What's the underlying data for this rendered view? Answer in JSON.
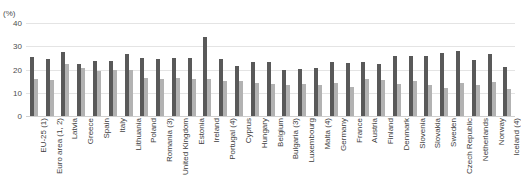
{
  "chart": {
    "title": "",
    "unit_label": "(%)"
  },
  "chart_data": {
    "type": "bar",
    "title": "",
    "xlabel": "",
    "ylabel": "(%)",
    "ylim": [
      0,
      40
    ],
    "yticks": [
      0,
      10,
      20,
      30,
      40
    ],
    "grid": true,
    "legend_position": "none",
    "categories": [
      "EU-25 (1)",
      "Euro area (1, 2)",
      "Latvia",
      "Greece",
      "Spain",
      "Italy",
      "Lithuania",
      "Poland",
      "Romania (3)",
      "United Kingdom",
      "Estonia",
      "Ireland",
      "Portugal (4)",
      "Cyprus",
      "Hungary",
      "Belgium",
      "Bulgaria (3)",
      "Luxembourg",
      "Malta (4)",
      "Germany",
      "France",
      "Austria",
      "Finland",
      "Denmark",
      "Slovenia",
      "Slovakia",
      "Sweden",
      "Czech Republic",
      "Netherlands",
      "Norway",
      "Iceland (4)"
    ],
    "series": [
      {
        "name": "Series 1",
        "color": "#595959",
        "values": [
          25.5,
          24.7,
          27.6,
          22.5,
          23.5,
          23.7,
          26.6,
          24.8,
          24.5,
          25.0,
          24.8,
          33.8,
          24.4,
          21.6,
          23.1,
          23.4,
          20.0,
          20.4,
          20.6,
          23.2,
          22.9,
          23.1,
          22.5,
          25.8,
          25.8,
          25.6,
          26.9,
          28.0,
          24.2,
          26.8,
          21.0
        ]
      },
      {
        "name": "Series 2",
        "color": "#b2b2b2",
        "values": [
          15.8,
          15.7,
          22.5,
          20.7,
          19.5,
          19.7,
          19.6,
          16.5,
          16.0,
          16.2,
          15.8,
          16.0,
          15.0,
          15.0,
          14.2,
          13.8,
          13.3,
          13.7,
          13.5,
          14.0,
          12.5,
          16.0,
          15.3,
          13.6,
          15.2,
          13.2,
          12.0,
          14.2,
          13.4,
          14.5,
          11.5
        ]
      }
    ]
  }
}
